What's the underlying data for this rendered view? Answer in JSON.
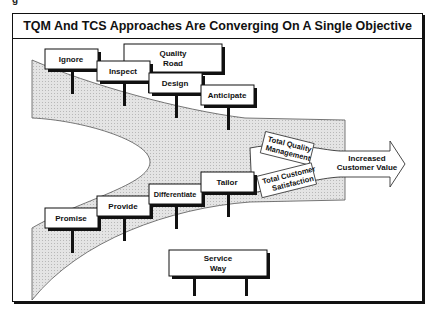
{
  "figure": {
    "title": "TQM And TCS Approaches Are Converging On A Single Objective",
    "top_road": {
      "line1": "Quality",
      "line2": "Road"
    },
    "bottom_road": {
      "line1": "Service",
      "line2": "Way"
    },
    "quality_steps": [
      "Ignore",
      "Inspect",
      "Design",
      "Anticipate"
    ],
    "service_steps": [
      "Promise",
      "Provide",
      "Differentiate",
      "Tailor"
    ],
    "merge_upper": {
      "line1": "Total Quality",
      "line2": "Management"
    },
    "merge_lower": {
      "line1": "Total Customer",
      "line2": "Satisfaction"
    },
    "outcome": {
      "line1": "Increased",
      "line2": "Customer Value"
    }
  },
  "colors": {
    "stroke": "#111111",
    "shade": "#dcdcdc",
    "background": "#ffffff"
  }
}
